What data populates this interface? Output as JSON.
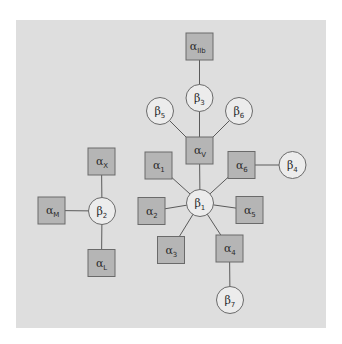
{
  "diagram": {
    "type": "integrin subunit network",
    "colors": {
      "panel": "#dedede",
      "alpha_fill": "#b5b5b5",
      "beta_fill": "#ececec",
      "stroke": "#6a6a6a"
    },
    "nodes": [
      {
        "id": "aIIb",
        "kind": "alpha",
        "base": "α",
        "sub": "IIb",
        "x": 199.5,
        "y": 46.5
      },
      {
        "id": "b3",
        "kind": "beta",
        "base": "β",
        "sub": "3",
        "x": 199.5,
        "y": 98
      },
      {
        "id": "b5",
        "kind": "beta",
        "base": "β",
        "sub": "5",
        "x": 160,
        "y": 111
      },
      {
        "id": "b6",
        "kind": "beta",
        "base": "β",
        "sub": "6",
        "x": 239,
        "y": 111
      },
      {
        "id": "aV",
        "kind": "alpha",
        "base": "α",
        "sub": "V",
        "x": 199.5,
        "y": 150.5
      },
      {
        "id": "a1",
        "kind": "alpha",
        "base": "α",
        "sub": "1",
        "x": 158.5,
        "y": 165.5
      },
      {
        "id": "a6",
        "kind": "alpha",
        "base": "α",
        "sub": "6",
        "x": 241.5,
        "y": 165
      },
      {
        "id": "b4",
        "kind": "beta",
        "base": "β",
        "sub": "4",
        "x": 292.5,
        "y": 165
      },
      {
        "id": "b1",
        "kind": "beta",
        "base": "β",
        "sub": "1",
        "x": 200,
        "y": 203
      },
      {
        "id": "a2",
        "kind": "alpha",
        "base": "α",
        "sub": "2",
        "x": 151.5,
        "y": 211
      },
      {
        "id": "a5",
        "kind": "alpha",
        "base": "α",
        "sub": "5",
        "x": 249.5,
        "y": 210
      },
      {
        "id": "a3",
        "kind": "alpha",
        "base": "α",
        "sub": "3",
        "x": 171,
        "y": 250
      },
      {
        "id": "a4",
        "kind": "alpha",
        "base": "α",
        "sub": "4",
        "x": 229.5,
        "y": 248.5
      },
      {
        "id": "b7",
        "kind": "beta",
        "base": "β",
        "sub": "7",
        "x": 230,
        "y": 300
      },
      {
        "id": "aX",
        "kind": "alpha",
        "base": "α",
        "sub": "X",
        "x": 101.5,
        "y": 161.5
      },
      {
        "id": "b2",
        "kind": "beta",
        "base": "β",
        "sub": "2",
        "x": 102,
        "y": 211
      },
      {
        "id": "aM",
        "kind": "alpha",
        "base": "α",
        "sub": "M",
        "x": 51.5,
        "y": 210.5
      },
      {
        "id": "aL",
        "kind": "alpha",
        "base": "α",
        "sub": "L",
        "x": 101.5,
        "y": 263
      }
    ],
    "edges": [
      [
        "aIIb",
        "b3"
      ],
      [
        "b3",
        "aV"
      ],
      [
        "b5",
        "aV"
      ],
      [
        "b6",
        "aV"
      ],
      [
        "aV",
        "b1"
      ],
      [
        "a1",
        "b1"
      ],
      [
        "a6",
        "b1"
      ],
      [
        "a6",
        "b4"
      ],
      [
        "a2",
        "b1"
      ],
      [
        "a5",
        "b1"
      ],
      [
        "a3",
        "b1"
      ],
      [
        "a4",
        "b1"
      ],
      [
        "a4",
        "b7"
      ],
      [
        "aX",
        "b2"
      ],
      [
        "aM",
        "b2"
      ],
      [
        "aL",
        "b2"
      ]
    ]
  }
}
